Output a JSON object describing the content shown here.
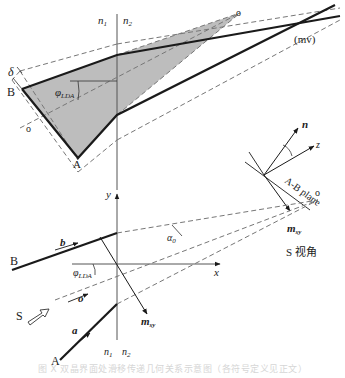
{
  "figure": {
    "top_panel": {
      "labels": {
        "n1": "n",
        "n1_sub": "1",
        "n2": "n",
        "n2_sub": "2",
        "delta": "δ",
        "B": "B",
        "A": "A",
        "phi": "φ",
        "phi_sub": "LDA",
        "o_left": "o",
        "o_right": "o",
        "mv": "(mv)"
      }
    },
    "side_view": {
      "labels": {
        "n": "n",
        "z": "z",
        "plane": "A-B plane",
        "m": "m",
        "m_sub": "sy",
        "view_title": "S 视角"
      }
    },
    "bottom_panel": {
      "labels": {
        "y": "y",
        "x": "x",
        "o_point": "o",
        "alpha": "α",
        "alpha_sub": "0",
        "b": "b",
        "B": "B",
        "phi": "φ",
        "phi_sub": "LDA",
        "o_vec": "o",
        "S": "S",
        "m": "m",
        "m_sub": "sy",
        "a": "a",
        "A": "A",
        "n1": "n",
        "n1_sub": "1",
        "n2": "n",
        "n2_sub": "2"
      }
    },
    "caption": "图 X  双晶界面处滑移传递几何关系示意图（各符号定义见正文）"
  },
  "colors": {
    "line": "#1a1a1a",
    "dashed": "#777777",
    "shade": "#bdbdbd",
    "axis": "#555555"
  }
}
